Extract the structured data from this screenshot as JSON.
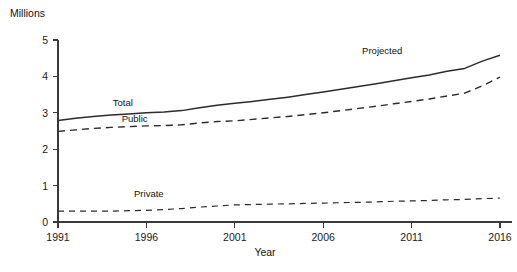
{
  "chart_data": {
    "type": "line",
    "title": "",
    "xlabel": "Year",
    "ylabel": "Millions",
    "ylabel_position": "top-left",
    "grid": false,
    "legend": "inline-labels",
    "xlim": [
      1991,
      2016
    ],
    "ylim": [
      0,
      5
    ],
    "x_ticks": [
      1991,
      1996,
      2001,
      2006,
      2011,
      2016
    ],
    "x_tick_labels": [
      "1991",
      "1996",
      "2001",
      "2006",
      "2011",
      "2016"
    ],
    "y_ticks": [
      0,
      1,
      2,
      3,
      4,
      5
    ],
    "y_tick_labels": [
      "0",
      "1",
      "2",
      "3",
      "4",
      "5"
    ],
    "x": [
      1991,
      1992,
      1993,
      1994,
      1995,
      1996,
      1997,
      1998,
      1999,
      2000,
      2001,
      2002,
      2003,
      2004,
      2005,
      2006,
      2007,
      2008,
      2009,
      2010,
      2011,
      2012,
      2013,
      2014,
      2015,
      2016
    ],
    "series": [
      {
        "name": "Total",
        "label": "Total",
        "style": "solid",
        "color": "#2b2b2b",
        "values": [
          2.79,
          2.85,
          2.9,
          2.94,
          2.97,
          3.0,
          3.02,
          3.06,
          3.14,
          3.21,
          3.26,
          3.31,
          3.37,
          3.43,
          3.5,
          3.57,
          3.65,
          3.72,
          3.8,
          3.88,
          3.96,
          4.04,
          4.14,
          4.22,
          4.42,
          4.58
        ]
      },
      {
        "name": "Public",
        "label": "Public",
        "style": "dashed",
        "color": "#2b2b2b",
        "values": [
          2.49,
          2.53,
          2.57,
          2.6,
          2.62,
          2.64,
          2.65,
          2.67,
          2.72,
          2.76,
          2.78,
          2.82,
          2.86,
          2.9,
          2.95,
          3.0,
          3.06,
          3.12,
          3.18,
          3.25,
          3.31,
          3.38,
          3.46,
          3.54,
          3.74,
          3.98
        ]
      },
      {
        "name": "Private",
        "label": "Private",
        "style": "dashed-thin",
        "color": "#2b2b2b",
        "values": [
          0.3,
          0.3,
          0.3,
          0.3,
          0.31,
          0.32,
          0.34,
          0.37,
          0.41,
          0.44,
          0.47,
          0.48,
          0.49,
          0.5,
          0.51,
          0.52,
          0.53,
          0.54,
          0.55,
          0.57,
          0.58,
          0.59,
          0.61,
          0.62,
          0.64,
          0.66
        ]
      }
    ],
    "annotations": [
      {
        "text": "Projected",
        "x": 2008.2,
        "y": 4.62,
        "name": "projected-annotation"
      },
      {
        "text": "Total",
        "x": 1994.1,
        "y": 3.18,
        "name": "total-series-label"
      },
      {
        "text": "Public",
        "x": 1994.6,
        "y": 2.76,
        "name": "public-series-label"
      },
      {
        "text": "Private",
        "x": 1995.3,
        "y": 0.7,
        "name": "private-series-label"
      }
    ]
  },
  "plot_geometry": {
    "left": 58,
    "right": 500,
    "top": 40,
    "bottom": 222
  }
}
